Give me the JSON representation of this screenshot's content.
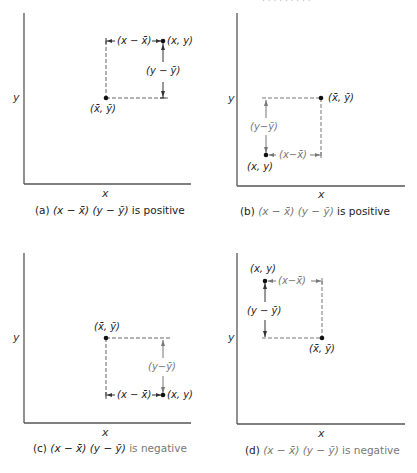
{
  "figure": {
    "top_cropped_text": "· · · · · · · · ·",
    "panels": [
      {
        "id": "a",
        "axis_x_label": "x",
        "axis_y_label": "y",
        "mean_point_label": "(x̄, ȳ)",
        "data_point_label": "(x, y)",
        "dx_label": "(x − x̄)",
        "dy_label": "(y − ȳ)",
        "caption_prefix": "(a)",
        "caption_expr": "(x − x̄) (y − ȳ)",
        "caption_suffix": "is positive"
      },
      {
        "id": "b",
        "axis_x_label": "x",
        "axis_y_label": "y",
        "mean_point_label": "(x̄, ȳ)",
        "data_point_label": "(x, y)",
        "dx_label": "(x−x̄)",
        "dy_label": "(y−ȳ)",
        "caption_prefix": "(b)",
        "caption_expr": "(x − x̄) (y − ȳ)",
        "caption_suffix": "is positive"
      },
      {
        "id": "c",
        "axis_x_label": "x",
        "axis_y_label": "y",
        "mean_point_label": "(x̄, ȳ)",
        "data_point_label": "(x, y)",
        "dx_label": "(x − x̄)",
        "dy_label": "(y−ȳ)",
        "caption_prefix": "(c)",
        "caption_expr": "(x − x̄) (y − ȳ)",
        "caption_suffix": "is negative"
      },
      {
        "id": "d",
        "axis_x_label": "x",
        "axis_y_label": "y",
        "mean_point_label": "(x̄, ȳ)",
        "data_point_label": "(x, y)",
        "dx_label": "(x−x̄)",
        "dy_label": "(y − ȳ)",
        "caption_prefix": "(d)",
        "caption_expr": "(x − x̄) (y − ȳ)",
        "caption_suffix": "is negative"
      }
    ],
    "colors": {
      "axis": "#444444",
      "dashed": "#666666",
      "point": "#111111",
      "gray_text": "#777777"
    }
  }
}
